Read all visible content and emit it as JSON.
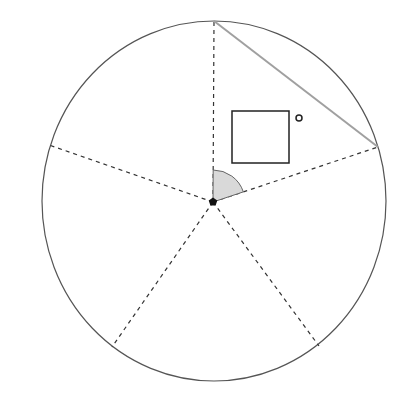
{
  "diagram": {
    "canvas": {
      "width": 413,
      "height": 408,
      "background": "#ffffff"
    },
    "circle": {
      "cx": 214,
      "cy": 201,
      "rx": 172,
      "ry": 180,
      "stroke": "#555555"
    },
    "center_point": {
      "x": 213,
      "y": 202,
      "shape": "pentagon-dot",
      "fill": "#111111"
    },
    "spokes": [
      {
        "x": 214,
        "y": 21
      },
      {
        "x": 378,
        "y": 147
      },
      {
        "x": 49,
        "y": 145
      },
      {
        "x": 112,
        "y": 347
      },
      {
        "x": 319,
        "y": 346
      }
    ],
    "spoke_style": {
      "stroke": "#333333",
      "dash": "4,4"
    },
    "chord": {
      "x1": 214,
      "y1": 21,
      "x2": 378,
      "y2": 147,
      "stroke": "#a0a0a0"
    },
    "angle_wedge": {
      "radius": 32,
      "fill": "#d9d9d9",
      "stroke": "#666666"
    },
    "square": {
      "x": 232,
      "y": 111,
      "width": 57,
      "height": 52,
      "stroke": "#222222"
    },
    "small_circle": {
      "cx": 299,
      "cy": 118,
      "r": 3,
      "stroke": "#222222"
    }
  }
}
